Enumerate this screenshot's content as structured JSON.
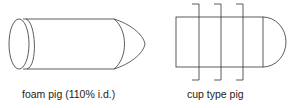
{
  "figure": {
    "left": {
      "label": "foam pig (110% i.d.)",
      "shape": "foam-pig"
    },
    "right": {
      "label": "cup type pig",
      "shape": "cup-pig"
    }
  },
  "colors": {
    "stroke": "#333333",
    "text": "#222222",
    "background": "#ffffff"
  }
}
